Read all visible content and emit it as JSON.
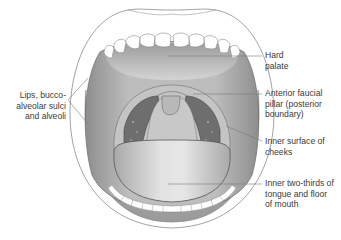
{
  "figure": {
    "colors": {
      "background": "#ffffff",
      "lip_outline": "#8a8a8a",
      "mouth_interior": "#b8b8b8",
      "palate": "#c9c9c9",
      "throat_dark": "#6e6e6e",
      "tongue": "#cfcfcf",
      "teeth": "#ffffff",
      "leader_line": "#7a7a7a",
      "text": "#3a3a3a"
    }
  },
  "labels": [
    {
      "id": "hard-palate",
      "text": "Hard\npalate",
      "side": "right"
    },
    {
      "id": "anterior-faucial-pillar",
      "text": "Anterior faucial\npillar (posterior\nboundary)",
      "side": "right"
    },
    {
      "id": "inner-surface-cheeks",
      "text": "Inner surface of\ncheeks",
      "side": "right"
    },
    {
      "id": "inner-two-thirds-tongue",
      "text": "Inner two-thirds of\ntongue and floor\nof mouth",
      "side": "right"
    },
    {
      "id": "lips-buccoalveolar",
      "text": "Lips, bucco-\nalveolar sulci\nand alveoli",
      "side": "left"
    }
  ]
}
